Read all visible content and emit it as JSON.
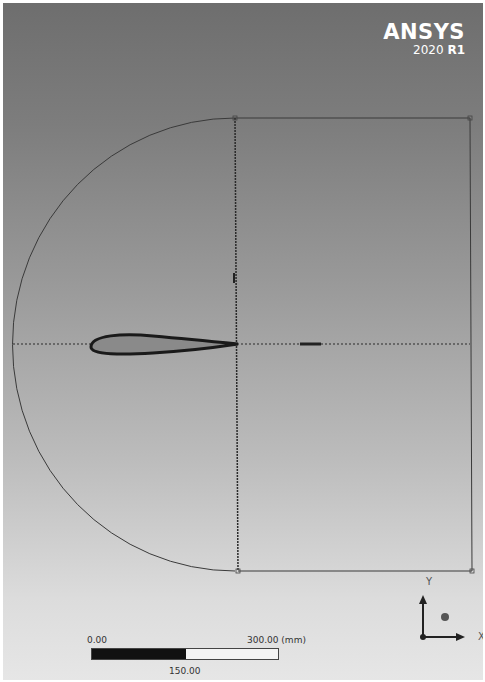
{
  "brand": {
    "name": "ANSYS",
    "version_year": "2020",
    "version_release": "R1"
  },
  "scale_bar": {
    "start_label": "0.00",
    "end_label": "300.00 (mm)",
    "mid_label": "150.00"
  },
  "triad": {
    "x_label": "X",
    "y_label": "Y"
  },
  "geometry": {
    "domain_shape": "C-type fluid domain (semicircle inlet + rectangle)",
    "body": "airfoil",
    "colors": {
      "lines": "#333333",
      "airfoil_outline": "#1a1a1a",
      "airfoil_fill": "#8a8a8a"
    }
  }
}
